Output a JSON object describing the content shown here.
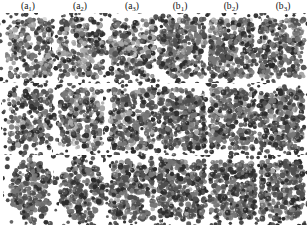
{
  "figure": {
    "background_color": "#ffffff",
    "layout": {
      "rows": 3,
      "columns": 6,
      "width": 307,
      "height": 228
    },
    "column_labels": [
      {
        "name": "panel-label-a1",
        "base": "(a",
        "sub": "1",
        "close": ")",
        "center_x": 28
      },
      {
        "name": "panel-label-a2",
        "base": "(a",
        "sub": "2",
        "close": ")",
        "center_x": 80
      },
      {
        "name": "panel-label-a3",
        "base": "(a",
        "sub": "3",
        "close": ")",
        "center_x": 132
      },
      {
        "name": "panel-label-b1",
        "base": "(b",
        "sub": "1",
        "close": ")",
        "center_x": 180
      },
      {
        "name": "panel-label-b2",
        "base": "(b",
        "sub": "2",
        "close": ")",
        "center_x": 231
      },
      {
        "name": "panel-label-b3",
        "base": "(b",
        "sub": "3",
        "close": ")",
        "center_x": 283
      }
    ],
    "particle_colors": {
      "dark": "#2b2b2b",
      "mid_dark": "#4f4f4f",
      "mid": "#777777",
      "light": "#a8a8a8",
      "highlight": "#d0d0d0"
    },
    "panels": [
      {
        "name": "panel-a1-row1",
        "column": "a1",
        "row": 1,
        "x": 6,
        "y": 18,
        "w": 46,
        "h": 60,
        "density": 0.62,
        "darkness": 0.48,
        "shape": "slab",
        "seed": 11
      },
      {
        "name": "panel-a2-row1",
        "column": "a2",
        "row": 1,
        "x": 58,
        "y": 18,
        "w": 46,
        "h": 60,
        "density": 0.7,
        "darkness": 0.46,
        "shape": "slab",
        "seed": 22
      },
      {
        "name": "panel-a3-row1",
        "column": "a3",
        "row": 1,
        "x": 110,
        "y": 18,
        "w": 46,
        "h": 60,
        "density": 0.72,
        "darkness": 0.4,
        "shape": "slab",
        "seed": 33
      },
      {
        "name": "panel-b1-row1",
        "column": "b1",
        "row": 1,
        "x": 158,
        "y": 18,
        "w": 48,
        "h": 60,
        "density": 0.82,
        "darkness": 0.58,
        "shape": "slab",
        "seed": 44
      },
      {
        "name": "panel-b2-row1",
        "column": "b2",
        "row": 1,
        "x": 209,
        "y": 18,
        "w": 46,
        "h": 60,
        "density": 0.8,
        "darkness": 0.56,
        "shape": "slab",
        "seed": 55
      },
      {
        "name": "panel-b3-row1",
        "column": "b3",
        "row": 1,
        "x": 259,
        "y": 18,
        "w": 46,
        "h": 60,
        "density": 0.78,
        "darkness": 0.55,
        "shape": "slab",
        "seed": 66
      },
      {
        "name": "panel-a1-row2",
        "column": "a1",
        "row": 2,
        "x": 8,
        "y": 88,
        "w": 44,
        "h": 62,
        "density": 0.64,
        "darkness": 0.52,
        "shape": "slab",
        "seed": 77
      },
      {
        "name": "panel-a2-row2",
        "column": "a2",
        "row": 2,
        "x": 59,
        "y": 88,
        "w": 45,
        "h": 62,
        "density": 0.7,
        "darkness": 0.5,
        "shape": "slab",
        "seed": 88
      },
      {
        "name": "panel-a3-row2",
        "column": "a3",
        "row": 2,
        "x": 110,
        "y": 88,
        "w": 46,
        "h": 62,
        "density": 0.74,
        "darkness": 0.47,
        "shape": "slab",
        "seed": 99
      },
      {
        "name": "panel-b1-row2",
        "column": "b1",
        "row": 2,
        "x": 158,
        "y": 88,
        "w": 48,
        "h": 62,
        "density": 0.84,
        "darkness": 0.6,
        "shape": "slab",
        "seed": 110
      },
      {
        "name": "panel-b2-row2",
        "column": "b2",
        "row": 2,
        "x": 209,
        "y": 88,
        "w": 47,
        "h": 62,
        "density": 0.82,
        "darkness": 0.58,
        "shape": "slab",
        "seed": 121
      },
      {
        "name": "panel-b3-row2",
        "column": "b3",
        "row": 2,
        "x": 259,
        "y": 88,
        "w": 46,
        "h": 62,
        "density": 0.8,
        "darkness": 0.57,
        "shape": "slab",
        "seed": 132
      },
      {
        "name": "panel-a1-row3",
        "column": "a1",
        "row": 3,
        "x": 10,
        "y": 160,
        "w": 42,
        "h": 60,
        "density": 0.7,
        "darkness": 0.66,
        "shape": "blob",
        "seed": 143
      },
      {
        "name": "panel-a2-row3",
        "column": "a2",
        "row": 3,
        "x": 60,
        "y": 160,
        "w": 44,
        "h": 60,
        "density": 0.74,
        "darkness": 0.63,
        "shape": "blob",
        "seed": 154
      },
      {
        "name": "panel-a3-row3",
        "column": "a3",
        "row": 3,
        "x": 110,
        "y": 160,
        "w": 46,
        "h": 60,
        "density": 0.8,
        "darkness": 0.62,
        "shape": "slab",
        "seed": 165
      },
      {
        "name": "panel-b1-row3",
        "column": "b1",
        "row": 3,
        "x": 158,
        "y": 160,
        "w": 48,
        "h": 60,
        "density": 0.84,
        "darkness": 0.66,
        "shape": "slab",
        "seed": 176
      },
      {
        "name": "panel-b2-row3",
        "column": "b2",
        "row": 3,
        "x": 209,
        "y": 160,
        "w": 47,
        "h": 60,
        "density": 0.84,
        "darkness": 0.64,
        "shape": "slab",
        "seed": 187
      },
      {
        "name": "panel-b3-row3",
        "column": "b3",
        "row": 3,
        "x": 259,
        "y": 160,
        "w": 45,
        "h": 60,
        "density": 0.82,
        "darkness": 0.63,
        "shape": "slab",
        "seed": 198
      }
    ]
  }
}
